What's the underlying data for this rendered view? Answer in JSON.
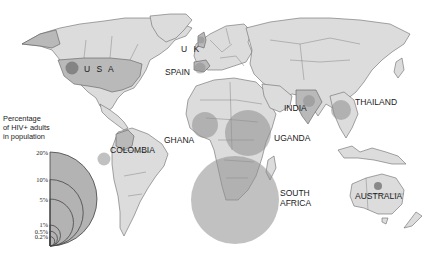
{
  "title": "Percentage of HIV+ adults in population",
  "legend": {
    "title_lines": [
      "Percentage",
      "of HIV+ adults",
      "in population"
    ],
    "ticks": [
      {
        "label": "20%",
        "value": 20
      },
      {
        "label": "10%",
        "value": 10
      },
      {
        "label": "5%",
        "value": 5
      },
      {
        "label": "1%",
        "value": 1
      },
      {
        "label": "0.5%",
        "value": 0.5
      },
      {
        "label": "0.2%",
        "value": 0.2
      }
    ]
  },
  "countries": [
    {
      "name": "USA",
      "label": "U S A",
      "prevalence_pct": 0.6
    },
    {
      "name": "UK",
      "label": "U K",
      "prevalence_pct": 0.2
    },
    {
      "name": "Spain",
      "label": "SPAIN",
      "prevalence_pct": 0.5
    },
    {
      "name": "Colombia",
      "label": "COLOMBIA",
      "prevalence_pct": 0.6
    },
    {
      "name": "Ghana",
      "label": "GHANA",
      "prevalence_pct": 3
    },
    {
      "name": "Uganda",
      "label": "UGANDA",
      "prevalence_pct": 7
    },
    {
      "name": "India",
      "label": "INDIA",
      "prevalence_pct": 0.9
    },
    {
      "name": "Thailand",
      "label": "THAILAND",
      "prevalence_pct": 1.5
    },
    {
      "name": "South Africa",
      "label_lines": [
        "SOUTH",
        "AFRICA"
      ],
      "prevalence_pct": 20
    },
    {
      "name": "Australia",
      "label": "AUSTRALIA",
      "prevalence_pct": 0.15
    }
  ],
  "colors": {
    "land": "#dcdcdc",
    "highlight_land": "#b9b9b9",
    "bubble": "#8e8e8e",
    "background": "#ffffff"
  }
}
